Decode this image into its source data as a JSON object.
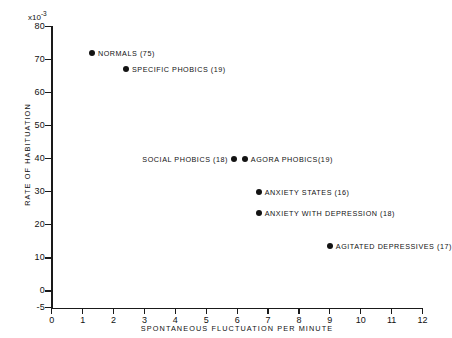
{
  "chart_data": {
    "type": "scatter",
    "title": "",
    "xlabel": "SPONTANEOUS   FLUCTUATION   PER   MINUTE",
    "ylabel": "RATE   OF   HABITUATION",
    "y_exponent_note": "x10",
    "y_exponent_power": "-3",
    "xlim": [
      0,
      12
    ],
    "ylim": [
      -5,
      80
    ],
    "xticks": [
      "0",
      "1",
      "2",
      "3",
      "4",
      "5",
      "6",
      "7",
      "8",
      "9",
      "10",
      "11",
      "12"
    ],
    "xtick_values": [
      0,
      1,
      2,
      3,
      4,
      5,
      6,
      7,
      8,
      9,
      10,
      11,
      12
    ],
    "yticks": [
      "80",
      "70",
      "60",
      "50",
      "40",
      "30",
      "20",
      "10",
      "0",
      "-5"
    ],
    "ytick_values": [
      80,
      70,
      60,
      50,
      40,
      30,
      20,
      10,
      0,
      -5
    ],
    "grid": false,
    "legend": "inline-annotations",
    "marker_color": "#131313",
    "axis_color": "#1a1a1a",
    "points": [
      {
        "label": "NORMALS (75)",
        "group": "Normals",
        "n": 75,
        "x": 1.3,
        "y": 72,
        "label_side": "right"
      },
      {
        "label": "SPECIFIC  PHOBICS  (19)",
        "group": "Specific phobics",
        "n": 19,
        "x": 2.4,
        "y": 67,
        "label_side": "right"
      },
      {
        "label": "SOCIAL PHOBICS (18)",
        "group": "Social phobics",
        "n": 18,
        "x": 5.9,
        "y": 40,
        "label_side": "left"
      },
      {
        "label": "AGORA PHOBICS(19)",
        "group": "Agora phobics",
        "n": 19,
        "x": 6.25,
        "y": 40,
        "label_side": "right"
      },
      {
        "label": "ANXIETY  STATES  (16)",
        "group": "Anxiety states",
        "n": 16,
        "x": 6.7,
        "y": 30,
        "label_side": "right"
      },
      {
        "label": "ANXIETY  WITH  DEPRESSION  (18)",
        "group": "Anxiety with depression",
        "n": 18,
        "x": 6.7,
        "y": 23.5,
        "label_side": "right"
      },
      {
        "label": "AGITATED  DEPRESSIVES (17)",
        "group": "Agitated depressives",
        "n": 17,
        "x": 9.0,
        "y": 13.5,
        "label_side": "right"
      }
    ]
  }
}
